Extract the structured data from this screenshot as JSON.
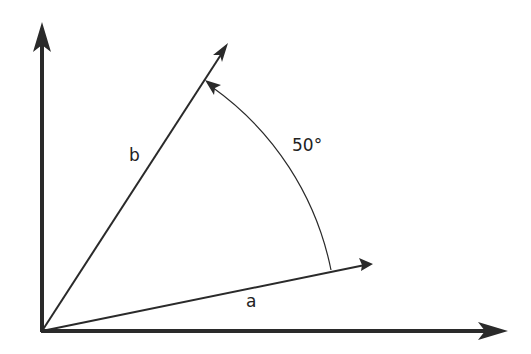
{
  "diagram": {
    "vector_a_label": "a",
    "vector_b_label": "b",
    "angle_label": "50°",
    "colors": {
      "stroke": "#2a2a2a",
      "background": "#ffffff"
    }
  }
}
